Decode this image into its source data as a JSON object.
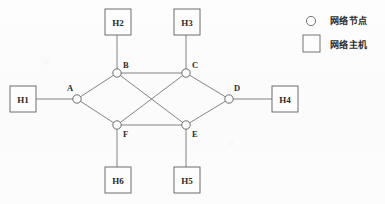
{
  "diagram": {
    "nodes": [
      {
        "id": "A",
        "label": "A",
        "cx": 77,
        "cy": 99,
        "r": 4.2,
        "label_x": 67,
        "label_y": 91
      },
      {
        "id": "B",
        "label": "B",
        "cx": 117,
        "cy": 73,
        "r": 4.2,
        "label_x": 123,
        "label_y": 68
      },
      {
        "id": "C",
        "label": "C",
        "cx": 186,
        "cy": 73,
        "r": 4.2,
        "label_x": 192,
        "label_y": 68
      },
      {
        "id": "D",
        "label": "D",
        "cx": 229,
        "cy": 99,
        "r": 4.2,
        "label_x": 234,
        "label_y": 91
      },
      {
        "id": "E",
        "label": "E",
        "cx": 186,
        "cy": 125,
        "r": 4.2,
        "label_x": 192,
        "label_y": 137
      },
      {
        "id": "F",
        "label": "F",
        "cx": 117,
        "cy": 125,
        "r": 4.2,
        "label_x": 123,
        "label_y": 137
      }
    ],
    "hosts": [
      {
        "id": "H1",
        "label": "H1",
        "x": 10,
        "y": 86,
        "w": 26,
        "h": 26
      },
      {
        "id": "H2",
        "label": "H2",
        "x": 105,
        "y": 9,
        "w": 26,
        "h": 26
      },
      {
        "id": "H3",
        "label": "H3",
        "x": 174,
        "y": 9,
        "w": 26,
        "h": 26
      },
      {
        "id": "H4",
        "label": "H4",
        "x": 272,
        "y": 86,
        "w": 26,
        "h": 26
      },
      {
        "id": "H5",
        "label": "H5",
        "x": 174,
        "y": 167,
        "w": 26,
        "h": 26
      },
      {
        "id": "H6",
        "label": "H6",
        "x": 105,
        "y": 167,
        "w": 26,
        "h": 26
      }
    ],
    "edges": [
      {
        "from": "A",
        "to": "B",
        "x1": 77,
        "y1": 99,
        "x2": 117,
        "y2": 73
      },
      {
        "from": "A",
        "to": "F",
        "x1": 77,
        "y1": 99,
        "x2": 117,
        "y2": 125
      },
      {
        "from": "B",
        "to": "C",
        "x1": 117,
        "y1": 73,
        "x2": 186,
        "y2": 73
      },
      {
        "from": "B",
        "to": "E",
        "x1": 117,
        "y1": 73,
        "x2": 186,
        "y2": 125
      },
      {
        "from": "C",
        "to": "F",
        "x1": 186,
        "y1": 73,
        "x2": 117,
        "y2": 125
      },
      {
        "from": "C",
        "to": "D",
        "x1": 186,
        "y1": 73,
        "x2": 229,
        "y2": 99
      },
      {
        "from": "D",
        "to": "E",
        "x1": 229,
        "y1": 99,
        "x2": 186,
        "y2": 125
      },
      {
        "from": "E",
        "to": "F",
        "x1": 186,
        "y1": 125,
        "x2": 117,
        "y2": 125
      }
    ],
    "host_links": [
      {
        "host": "H1",
        "node": "A",
        "x1": 36,
        "y1": 99,
        "x2": 73,
        "y2": 99
      },
      {
        "host": "H2",
        "node": "B",
        "x1": 117,
        "y1": 35,
        "x2": 117,
        "y2": 69
      },
      {
        "host": "H3",
        "node": "C",
        "x1": 186,
        "y1": 35,
        "x2": 186,
        "y2": 69
      },
      {
        "host": "H4",
        "node": "D",
        "x1": 233,
        "y1": 99,
        "x2": 272,
        "y2": 99
      },
      {
        "host": "H5",
        "node": "E",
        "x1": 186,
        "y1": 129,
        "x2": 186,
        "y2": 167
      },
      {
        "host": "H6",
        "node": "F",
        "x1": 117,
        "y1": 129,
        "x2": 117,
        "y2": 167
      }
    ]
  },
  "legend": {
    "node_symbol": "circle",
    "node_text": "网络节点",
    "host_symbol": "square",
    "host_text": "网络主机"
  },
  "colors": {
    "stroke": "#5d5d5d",
    "edge": "#6e6e6e",
    "text": "#2b2b2b",
    "background": "#fdfdfd"
  }
}
